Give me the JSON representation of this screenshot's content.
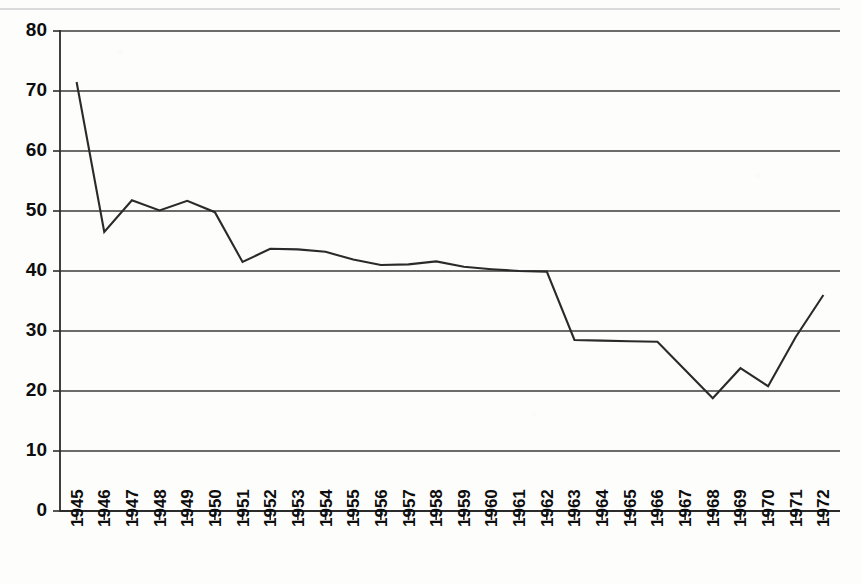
{
  "chart_data": {
    "type": "line",
    "title": "",
    "subtitle": "",
    "xlabel": "",
    "ylabel": "",
    "x": [
      1945,
      1946,
      1947,
      1948,
      1949,
      1950,
      1951,
      1952,
      1953,
      1954,
      1955,
      1956,
      1957,
      1958,
      1959,
      1960,
      1961,
      1962,
      1963,
      1964,
      1965,
      1966,
      1967,
      1968,
      1969,
      1970,
      1971,
      1972
    ],
    "categories": [
      "1945",
      "1946",
      "1947",
      "1948",
      "1949",
      "1950",
      "1951",
      "1952",
      "1953",
      "1954",
      "1955",
      "1956",
      "1957",
      "1958",
      "1959",
      "1960",
      "1961",
      "1962",
      "1963",
      "1964",
      "1965",
      "1966",
      "1967",
      "1968",
      "1969",
      "1970",
      "1971",
      "1972"
    ],
    "values": [
      71.5,
      46.5,
      51.8,
      50.1,
      51.7,
      49.8,
      41.5,
      43.7,
      43.6,
      43.2,
      41.9,
      41.0,
      41.1,
      41.6,
      40.7,
      40.3,
      40.0,
      39.9,
      28.5,
      28.4,
      28.3,
      28.2,
      23.5,
      18.8,
      23.8,
      20.8,
      29.0,
      36.0
    ],
    "series": [
      {
        "name": "series-1",
        "values": [
          71.5,
          46.5,
          51.8,
          50.1,
          51.7,
          49.8,
          41.5,
          43.7,
          43.6,
          43.2,
          41.9,
          41.0,
          41.1,
          41.6,
          40.7,
          40.3,
          40.0,
          39.9,
          28.5,
          28.4,
          28.3,
          28.2,
          23.5,
          18.8,
          23.8,
          20.8,
          29.0,
          36.0
        ]
      }
    ],
    "ylim": [
      0,
      80
    ],
    "yticks": [
      0,
      10,
      20,
      30,
      40,
      50,
      60,
      70,
      80
    ],
    "ytick_labels": [
      "0",
      "10",
      "20",
      "30",
      "40",
      "50",
      "60",
      "70",
      "80"
    ],
    "xtick_labels": [
      "1945",
      "1946",
      "1947",
      "1948",
      "1949",
      "1950",
      "1951",
      "1952",
      "1953",
      "1954",
      "1955",
      "1956",
      "1957",
      "1958",
      "1959",
      "1960",
      "1961",
      "1962",
      "1963",
      "1964",
      "1965",
      "1966",
      "1967",
      "1968",
      "1969",
      "1970",
      "1971",
      "1972"
    ],
    "xtick_rotation": -90,
    "grid": true,
    "grid_axis": "y",
    "legend": false,
    "legend_position": "none",
    "line_color": "#2a2a2a",
    "grid_color": "#3a3a3a",
    "axis_color": "#2b2b2b",
    "background_color": "#fdfdfc",
    "markers": false,
    "annotations": []
  }
}
